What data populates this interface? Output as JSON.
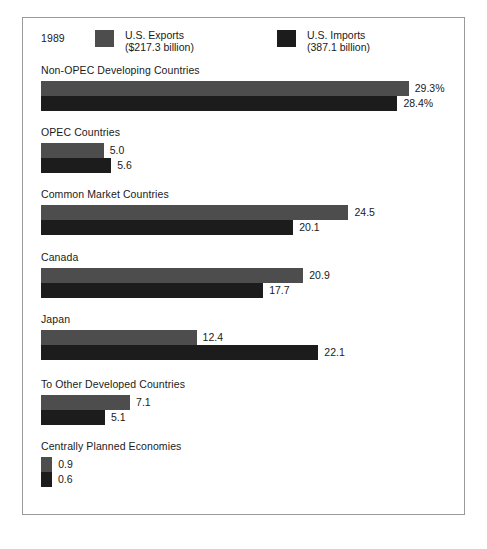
{
  "chart_data": {
    "type": "bar",
    "title": "",
    "subtitle": "",
    "year": "1989",
    "orientation": "horizontal",
    "xlabel": "",
    "ylabel": "",
    "grid": false,
    "legend_position": "top",
    "value_unit": "percent of total",
    "axis_note": "bar lengths proportional to value; scale about 12.6 px per unit",
    "xlim": [
      0,
      30
    ],
    "colors": {
      "exports": "#4d4d4d",
      "imports": "#1c1c1c",
      "frame": "#9a9a9a",
      "background": "#ffffff",
      "text": "#1a1a1a"
    },
    "legend": [
      {
        "name": "U.S. Exports",
        "amount": "($217.3 billion)",
        "color": "#4d4d4d"
      },
      {
        "name": "U.S. Imports",
        "amount": "(387.1 billion)",
        "color": "#1c1c1c"
      }
    ],
    "series": [
      {
        "name": "U.S. Exports",
        "values": [
          29.3,
          5.0,
          24.5,
          20.9,
          12.4,
          7.1,
          0.9
        ],
        "labels": [
          "29.3%",
          "5.0",
          "24.5",
          "20.9",
          "12.4",
          "7.1",
          "0.9"
        ]
      },
      {
        "name": "U.S. Imports",
        "values": [
          28.4,
          5.6,
          20.1,
          17.7,
          22.1,
          5.1,
          0.6
        ],
        "labels": [
          "28.4%",
          "5.6",
          "20.1",
          "17.7",
          "22.1",
          "5.1",
          "0.6"
        ]
      }
    ],
    "categories": [
      "Non-OPEC Developing Countries",
      "OPEC Countries",
      "Common Market Countries",
      "Canada",
      "Japan",
      "To Other Developed Countries",
      "Centrally Planned Economies"
    ],
    "groups": [
      {
        "label": "Non-OPEC Developing Countries",
        "bars": [
          {
            "series": "U.S. Exports",
            "value": 29.3,
            "label": "29.3%"
          },
          {
            "series": "U.S. Imports",
            "value": 28.4,
            "label": "28.4%"
          }
        ]
      },
      {
        "label": "OPEC Countries",
        "bars": [
          {
            "series": "U.S. Exports",
            "value": 5.0,
            "label": "5.0"
          },
          {
            "series": "U.S. Imports",
            "value": 5.6,
            "label": "5.6"
          }
        ]
      },
      {
        "label": "Common Market Countries",
        "bars": [
          {
            "series": "U.S. Exports",
            "value": 24.5,
            "label": "24.5"
          },
          {
            "series": "U.S. Imports",
            "value": 20.1,
            "label": "20.1"
          }
        ]
      },
      {
        "label": "Canada",
        "bars": [
          {
            "series": "U.S. Exports",
            "value": 20.9,
            "label": "20.9"
          },
          {
            "series": "U.S. Imports",
            "value": 17.7,
            "label": "17.7"
          }
        ]
      },
      {
        "label": "Japan",
        "bars": [
          {
            "series": "U.S. Exports",
            "value": 12.4,
            "label": "12.4"
          },
          {
            "series": "U.S. Imports",
            "value": 22.1,
            "label": "22.1"
          }
        ]
      },
      {
        "label": "To Other Developed Countries",
        "bars": [
          {
            "series": "U.S. Exports",
            "value": 7.1,
            "label": "7.1"
          },
          {
            "series": "U.S. Imports",
            "value": 5.1,
            "label": "5.1"
          }
        ]
      },
      {
        "label": "Centrally Planned Economies",
        "bars": [
          {
            "series": "U.S. Exports",
            "value": 0.9,
            "label": "0.9"
          },
          {
            "series": "U.S. Imports",
            "value": 0.6,
            "label": "0.6"
          }
        ]
      }
    ]
  }
}
